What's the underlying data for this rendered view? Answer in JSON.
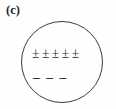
{
  "figure": {
    "panel_label": "(c)",
    "shape": "circle",
    "positive_row": {
      "symbol": "±",
      "count": 5,
      "symbols": [
        "±",
        "±",
        "±",
        "±",
        "±"
      ]
    },
    "negative_row": {
      "symbol": "–",
      "count": 3,
      "symbols": [
        "–",
        "–",
        "–"
      ]
    },
    "colors": {
      "background": "#fefefe",
      "outline": "#3a3a42",
      "text": "#24242a"
    }
  }
}
